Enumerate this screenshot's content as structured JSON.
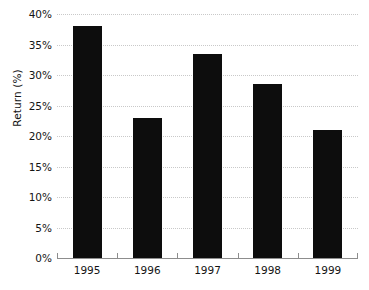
{
  "chart_data": {
    "type": "bar",
    "title": "",
    "subtitle": "",
    "xlabel": "",
    "ylabel": "Return (%)",
    "categories": [
      "1995",
      "1996",
      "1997",
      "1998",
      "1999"
    ],
    "values": [
      38,
      23,
      33.5,
      28.5,
      21
    ],
    "ylim": [
      0,
      40
    ],
    "y_ticks": [
      0,
      5,
      10,
      15,
      20,
      25,
      30,
      35,
      40
    ],
    "y_tick_labels": [
      "0%",
      "5%",
      "10%",
      "15%",
      "20%",
      "25%",
      "30%",
      "35%",
      "40%"
    ],
    "grid": true,
    "grid_style": "dotted",
    "legend": false,
    "legend_position": "none",
    "series": [
      {
        "name": "Return",
        "values": [
          38,
          23,
          33.5,
          28.5,
          21
        ]
      }
    ],
    "colors": {
      "bar": "#0d0d0d",
      "grid": "#c9c9c9",
      "axis": "#8d8d8d",
      "text": "#141414",
      "background": "#ffffff"
    }
  }
}
